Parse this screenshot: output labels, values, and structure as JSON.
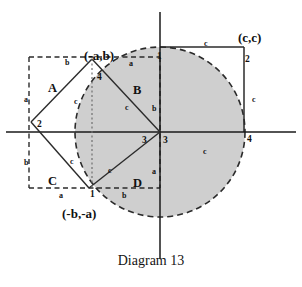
{
  "figure": {
    "caption": "Diagram 13",
    "colors": {
      "circle_fill": "#cfcfcf",
      "stroke": "#2b2b2b",
      "axis": "#1a1a1a",
      "text": "#111111"
    },
    "coordinate_labels": [
      {
        "name": "coord-top-left",
        "text": "(-a,b)",
        "x": 84,
        "y": 49
      },
      {
        "name": "coord-top-right",
        "text": "(c,c)",
        "x": 238,
        "y": 31
      },
      {
        "name": "coord-bottom",
        "text": "(-b,-a)",
        "x": 62,
        "y": 207
      }
    ],
    "region_labels": [
      {
        "name": "region-a",
        "text": "A",
        "x": 48,
        "y": 82
      },
      {
        "name": "region-b",
        "text": "B",
        "x": 133,
        "y": 84
      },
      {
        "name": "region-c",
        "text": "C",
        "x": 48,
        "y": 175
      },
      {
        "name": "region-d",
        "text": "D",
        "x": 133,
        "y": 177
      }
    ],
    "vertex_labels": [
      {
        "name": "vertex-1-top",
        "text": "1",
        "x": 157,
        "y": 52
      },
      {
        "name": "vertex-2-topright",
        "text": "2",
        "x": 245,
        "y": 55
      },
      {
        "name": "vertex-4-inner",
        "text": "4",
        "x": 97,
        "y": 73
      },
      {
        "name": "vertex-2-left",
        "text": "2",
        "x": 37,
        "y": 120
      },
      {
        "name": "vertex-3-left",
        "text": "3",
        "x": 142,
        "y": 136
      },
      {
        "name": "vertex-3-origin",
        "text": "3",
        "x": 160,
        "y": 136
      },
      {
        "name": "vertex-4-right",
        "text": "4",
        "x": 247,
        "y": 135
      },
      {
        "name": "vertex-1-bottom",
        "text": "1",
        "x": 90,
        "y": 190
      }
    ],
    "side_labels": [
      {
        "name": "side-c-top",
        "text": "c",
        "x": 204,
        "y": 40
      },
      {
        "name": "side-b-topleft",
        "text": "b",
        "x": 65,
        "y": 59
      },
      {
        "name": "side-a-topmid",
        "text": "a",
        "x": 129,
        "y": 60
      },
      {
        "name": "side-a-left",
        "text": "a",
        "x": 24,
        "y": 96
      },
      {
        "name": "side-c-regiona",
        "text": "c",
        "x": 74,
        "y": 98
      },
      {
        "name": "side-c-regionb",
        "text": "c",
        "x": 125,
        "y": 104
      },
      {
        "name": "side-b-regionb",
        "text": "b",
        "x": 152,
        "y": 105
      },
      {
        "name": "side-c-right",
        "text": "c",
        "x": 252,
        "y": 96
      },
      {
        "name": "side-b-leftlow",
        "text": "b",
        "x": 24,
        "y": 159
      },
      {
        "name": "side-c-regionc",
        "text": "c",
        "x": 70,
        "y": 158
      },
      {
        "name": "side-c-regiond",
        "text": "c",
        "x": 108,
        "y": 167
      },
      {
        "name": "side-a-regiond",
        "text": "a",
        "x": 152,
        "y": 168
      },
      {
        "name": "side-c-xaxis",
        "text": "c",
        "x": 203,
        "y": 148
      },
      {
        "name": "side-a-bottom",
        "text": "a",
        "x": 59,
        "y": 192
      },
      {
        "name": "side-b-bottom",
        "text": "b",
        "x": 122,
        "y": 192
      }
    ]
  },
  "geometry": {
    "origin": {
      "x": 160,
      "y": 132
    },
    "circle": {
      "cx": 160,
      "cy": 132,
      "r": 85
    },
    "square_outer": {
      "x1": 29,
      "y1": 57,
      "x2": 160,
      "y2": 188
    },
    "square_right": {
      "x1": 160,
      "y1": 47,
      "x2": 244,
      "y2": 132
    },
    "tilted_square": [
      {
        "name": "top",
        "x": 92,
        "y": 59
      },
      {
        "name": "right",
        "x": 160,
        "y": 132
      },
      {
        "name": "bottom",
        "x": 89,
        "y": 188
      },
      {
        "name": "left",
        "x": 31,
        "y": 122
      }
    ]
  }
}
